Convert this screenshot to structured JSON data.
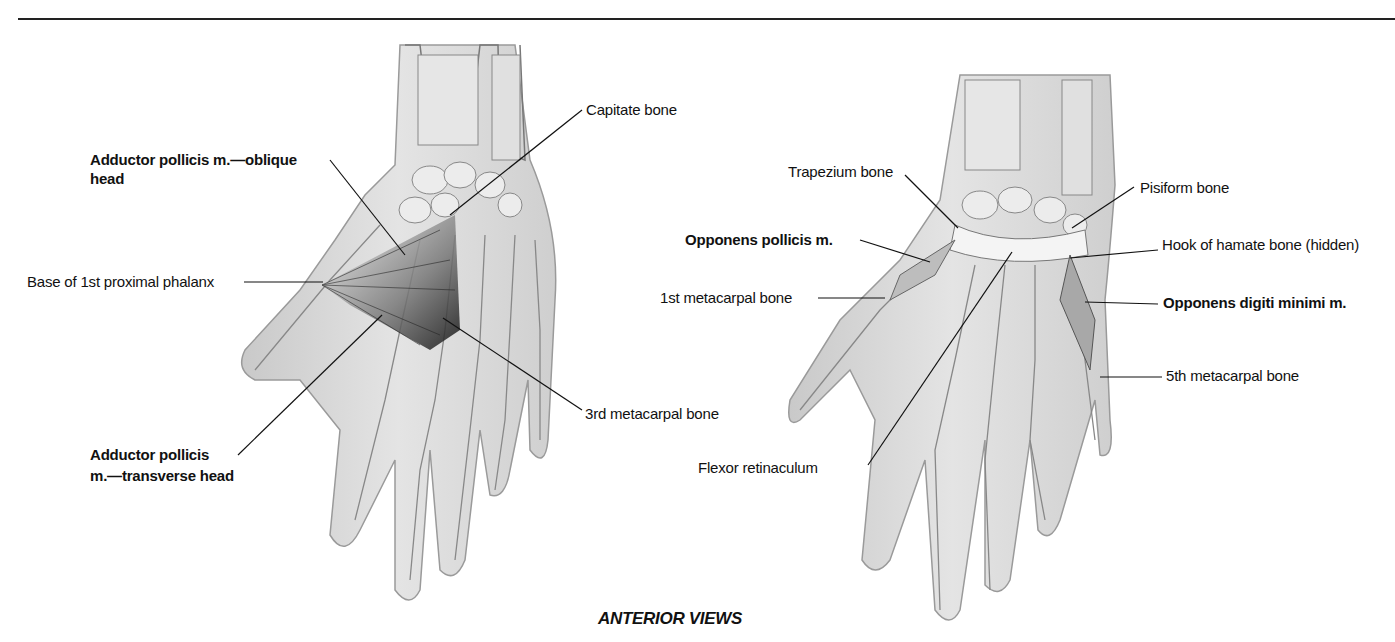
{
  "figure": {
    "caption": "ANTERIOR VIEWS",
    "left_view": {
      "labels": [
        {
          "text": "Adductor pollicis m.—oblique",
          "bold": true
        },
        {
          "text": "head",
          "bold": true
        },
        {
          "text": "Capitate bone",
          "bold": false
        },
        {
          "text": "Base of 1st proximal phalanx",
          "bold": false
        },
        {
          "text": "3rd metacarpal bone",
          "bold": false
        },
        {
          "text": "Adductor pollicis",
          "bold": true
        },
        {
          "text": "m.—transverse head",
          "bold": true
        }
      ]
    },
    "right_view": {
      "labels": [
        {
          "text": "Trapezium bone",
          "bold": false
        },
        {
          "text": "Pisiform bone",
          "bold": false
        },
        {
          "text": "Opponens pollicis m.",
          "bold": true
        },
        {
          "text": "Hook of hamate bone (hidden)",
          "bold": false
        },
        {
          "text": "1st metacarpal bone",
          "bold": false
        },
        {
          "text": "Opponens digiti minimi m.",
          "bold": true
        },
        {
          "text": "5th metacarpal bone",
          "bold": false
        },
        {
          "text": "Flexor retinaculum",
          "bold": false
        }
      ]
    },
    "colors": {
      "skin": "#d9d9d9",
      "bone": "#ececec",
      "outline": "#6e6e6e",
      "muscle": "#3a3a3a",
      "leader": "#111111"
    }
  }
}
